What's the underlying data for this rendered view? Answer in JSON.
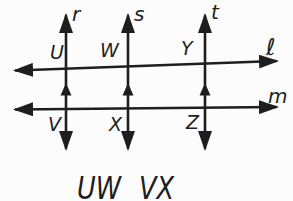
{
  "colors": {
    "ink": "#1e1e1e",
    "background": "#fcfcfc"
  },
  "figure": {
    "vertical_line_labels": {
      "r": "r",
      "s": "s",
      "t": "t"
    },
    "transversal_labels": {
      "ell": "ℓ",
      "m": "m"
    },
    "intersection_labels": {
      "U": "U",
      "W": "W",
      "Y": "Y",
      "V": "V",
      "X": "X",
      "Z": "Z"
    }
  },
  "caption": {
    "segment_1": "UW",
    "segment_2": "VX"
  }
}
